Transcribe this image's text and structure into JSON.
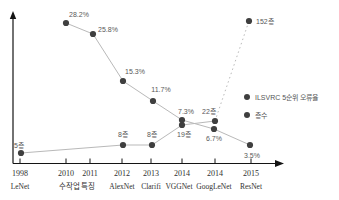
{
  "chart_data": {
    "type": "line",
    "title": "",
    "background": "#ffffff",
    "grid": false,
    "colors": {
      "dot": "#3f3f3f",
      "line": "#b9b9b9",
      "axis": "#141414",
      "data_label": "#595959",
      "axis_label": "#2f2f2f",
      "legend_text": "#555555"
    },
    "axes": {
      "origin_px": [
        13,
        163.5
      ],
      "x_end_px": 284,
      "y_end_px": 11,
      "tick_len": 5
    },
    "x_axis": {
      "year_baseline_y": 176,
      "net_baseline_y": 189,
      "categories": [
        {
          "year": "1998",
          "net": "LeNet",
          "tick_x": 20
        },
        {
          "year": "2010",
          "net": "",
          "tick_x": 66
        },
        {
          "year": "2011",
          "net": "",
          "tick_x": 90
        },
        {
          "year": "2012",
          "net": "AlexNet",
          "tick_x": 122
        },
        {
          "year": "2013",
          "net": "Clarifi",
          "tick_x": 151
        },
        {
          "year": "2014",
          "net": "VGGNet",
          "tick_x": 182,
          "net_x": 179
        },
        {
          "year": "2014",
          "net": "GoogLeNet",
          "tick_x": 215,
          "net_x": 214
        },
        {
          "year": "2015",
          "net": "ResNet",
          "tick_x": 251
        }
      ],
      "group_label": {
        "text": "수작업 특징",
        "x": 77,
        "applies_to": [
          "2010",
          "2011"
        ]
      }
    },
    "series": [
      {
        "name": "ILSVRC 5순위 오류율",
        "unit": "%",
        "points": [
          {
            "category": "2010",
            "value": 28.2,
            "label": "28.2%",
            "px": [
              66,
              23
            ],
            "label_px": [
              79,
              14
            ]
          },
          {
            "category": "2011",
            "value": 25.8,
            "label": "25.8%",
            "px": [
              93,
              34
            ],
            "label_px": [
              108,
              29
            ]
          },
          {
            "category": "2012",
            "value": 15.3,
            "label": "15.3%",
            "px": [
              123,
              81
            ],
            "label_px": [
              135,
              71
            ]
          },
          {
            "category": "2013",
            "value": 11.7,
            "label": "11.7%",
            "px": [
              153,
              101
            ],
            "label_px": [
              161,
              89
            ]
          },
          {
            "category": "2014 (VGGNet)",
            "value": 7.3,
            "label": "7.3%",
            "px": [
              182,
              120
            ],
            "label_px": [
              186,
              111
            ]
          },
          {
            "category": "2014 (GoogLeNet)",
            "value": 6.7,
            "label": "6.7%",
            "px": [
              214,
              129
            ],
            "label_px": [
              214,
              138
            ]
          },
          {
            "category": "2015",
            "value": 3.5,
            "label": "3.5%",
            "px": [
              250,
              145
            ],
            "label_px": [
              252,
              155
            ]
          }
        ]
      },
      {
        "name": "층수",
        "unit": "층",
        "points": [
          {
            "category": "1998",
            "value": 5,
            "label": "5층",
            "px": [
              21,
              153
            ],
            "label_px": [
              19,
              145
            ]
          },
          {
            "category": "2012",
            "value": 8,
            "label": "8층",
            "px": [
              123,
              145
            ],
            "label_px": [
              123,
              134
            ]
          },
          {
            "category": "2013",
            "value": 8,
            "label": "8층",
            "px": [
              152,
              145
            ],
            "label_px": [
              152,
              134
            ]
          },
          {
            "category": "2014 (VGGNet)",
            "value": 19,
            "label": "19층",
            "px": [
              182,
              125
            ],
            "label_px": [
              184,
              134
            ]
          },
          {
            "category": "2014 (GoogLeNet)",
            "value": 22,
            "label": "22층",
            "px": [
              215,
              121
            ],
            "label_px": [
              209,
              111
            ]
          },
          {
            "category": "2015",
            "value": 152,
            "label": "152층",
            "px": [
              249,
              21
            ],
            "label_px": [
              256,
              21
            ],
            "label_anchor": "start",
            "dash_to_prev": true
          }
        ]
      }
    ],
    "legend": {
      "position": "right-middle",
      "text_offset_x": 8,
      "items": [
        {
          "label": "ILSVRC 5순위 오류율",
          "marker": "dot",
          "dot_px": [
            247,
            97
          ]
        },
        {
          "label": "층수",
          "marker": "dot",
          "dot_px": [
            247,
            115
          ]
        }
      ]
    }
  }
}
